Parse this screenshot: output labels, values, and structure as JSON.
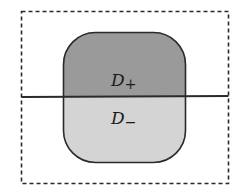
{
  "diagram": {
    "outer_region": {
      "style": "dashed-rectangle",
      "stroke": "#2a2a2a"
    },
    "domain": {
      "shape": "rounded-rectangle",
      "stroke": "#2a2a2a",
      "upper_fill": "#9a9a9a",
      "lower_fill": "#d4d4d4"
    },
    "dividing_line": {
      "stroke": "#2a2a2a"
    },
    "labels": {
      "upper": {
        "base": "D",
        "subscript": "+"
      },
      "lower": {
        "base": "D",
        "subscript": "−"
      }
    }
  }
}
